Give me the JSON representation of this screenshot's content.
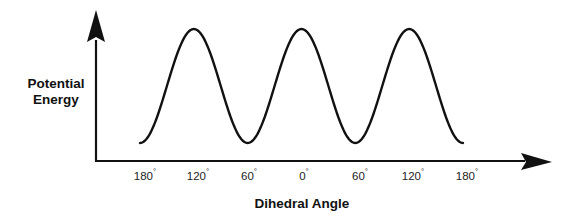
{
  "chart_data": {
    "type": "line",
    "title": "",
    "xlabel": "Dihedral Angle",
    "ylabel": "Potential Energy",
    "ylabel_lines": [
      "Potential",
      "Energy"
    ],
    "x_ticks": [
      "180°",
      "120°",
      "60°",
      "0°",
      "60°",
      "120°",
      "180°"
    ],
    "x_values_deg": [
      -180,
      -120,
      -60,
      0,
      60,
      120,
      180
    ],
    "series": [
      {
        "name": "Potential Energy",
        "description": "Threefold periodic torsional potential; maxima at -120°, 0°, 120°; minima at -60°, 60° and near ±180°",
        "x": [
          -180,
          -150,
          -120,
          -90,
          -60,
          -30,
          0,
          30,
          60,
          90,
          120,
          150,
          180
        ],
        "y": [
          0,
          0.5,
          1,
          0.5,
          0,
          0.5,
          1,
          0.5,
          0,
          0.5,
          1,
          0.5,
          0
        ]
      }
    ],
    "xlim": [
      -180,
      180
    ],
    "ylim": [
      0,
      1
    ],
    "grid": false,
    "legend": false,
    "axis_arrows": true,
    "y_ticks": []
  },
  "labels": {
    "y_line1": "Potential",
    "y_line2": "Energy",
    "x_axis": "Dihedral Angle",
    "ticks": [
      {
        "num": "180",
        "deg": "°"
      },
      {
        "num": "120",
        "deg": "°"
      },
      {
        "num": "60",
        "deg": "°"
      },
      {
        "num": "0",
        "deg": "°"
      },
      {
        "num": "60",
        "deg": "°"
      },
      {
        "num": "120",
        "deg": "°"
      },
      {
        "num": "180",
        "deg": "°"
      }
    ]
  },
  "colors": {
    "line": "#111111",
    "axis": "#111111",
    "background": "#ffffff"
  }
}
